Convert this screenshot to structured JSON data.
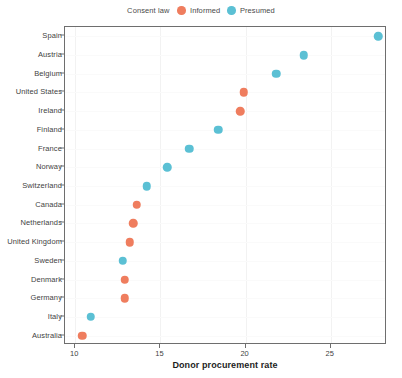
{
  "legend": {
    "title": "Consent law",
    "entries": [
      {
        "label": "Informed",
        "color": "#ef7d5e"
      },
      {
        "label": "Presumed",
        "color": "#5bc0d4"
      }
    ]
  },
  "axis": {
    "x_title": "Donor procurement rate",
    "x_ticks": [
      "10",
      "15",
      "20",
      "25"
    ]
  },
  "chart_data": {
    "type": "scatter",
    "title": "",
    "xlabel": "Donor procurement rate",
    "ylabel": "",
    "xlim": [
      9.4,
      28.3
    ],
    "xticks": [
      10,
      15,
      20,
      25
    ],
    "grid": true,
    "legend_position": "top-center",
    "legend_title": "Consent law",
    "orientation": "horizontal-dotplot",
    "categories": [
      "Spain",
      "Austria",
      "Belgium",
      "United States",
      "Ireland",
      "Finland",
      "France",
      "Norway",
      "Switzerland",
      "Canada",
      "Netherlands",
      "United Kingdom",
      "Sweden",
      "Denmark",
      "Germany",
      "Italy",
      "Australia"
    ],
    "series": [
      {
        "name": "Informed",
        "color": "#ef7d5e",
        "points": [
          {
            "category": "United States",
            "value": 19.9
          },
          {
            "category": "Ireland",
            "value": 19.7
          },
          {
            "category": "Canada",
            "value": 13.6
          },
          {
            "category": "Netherlands",
            "value": 13.4
          },
          {
            "category": "United Kingdom",
            "value": 13.2
          },
          {
            "category": "Denmark",
            "value": 12.9
          },
          {
            "category": "Germany",
            "value": 12.9
          },
          {
            "category": "Australia",
            "value": 10.4
          }
        ]
      },
      {
        "name": "Presumed",
        "color": "#5bc0d4",
        "points": [
          {
            "category": "Spain",
            "value": 27.8
          },
          {
            "category": "Austria",
            "value": 23.4
          },
          {
            "category": "Belgium",
            "value": 21.8
          },
          {
            "category": "Finland",
            "value": 18.4
          },
          {
            "category": "France",
            "value": 16.7
          },
          {
            "category": "Norway",
            "value": 15.4
          },
          {
            "category": "Switzerland",
            "value": 14.2
          },
          {
            "category": "Sweden",
            "value": 12.8
          },
          {
            "category": "Italy",
            "value": 10.9
          }
        ]
      }
    ]
  }
}
